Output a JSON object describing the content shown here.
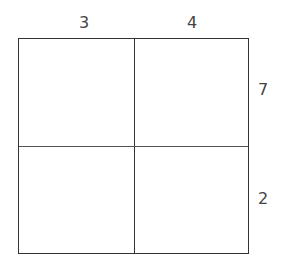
{
  "diagram": {
    "top_labels": [
      "3",
      "4"
    ],
    "side_labels": [
      "7",
      "2"
    ],
    "grid": {
      "rows": 2,
      "cols": 2
    }
  }
}
